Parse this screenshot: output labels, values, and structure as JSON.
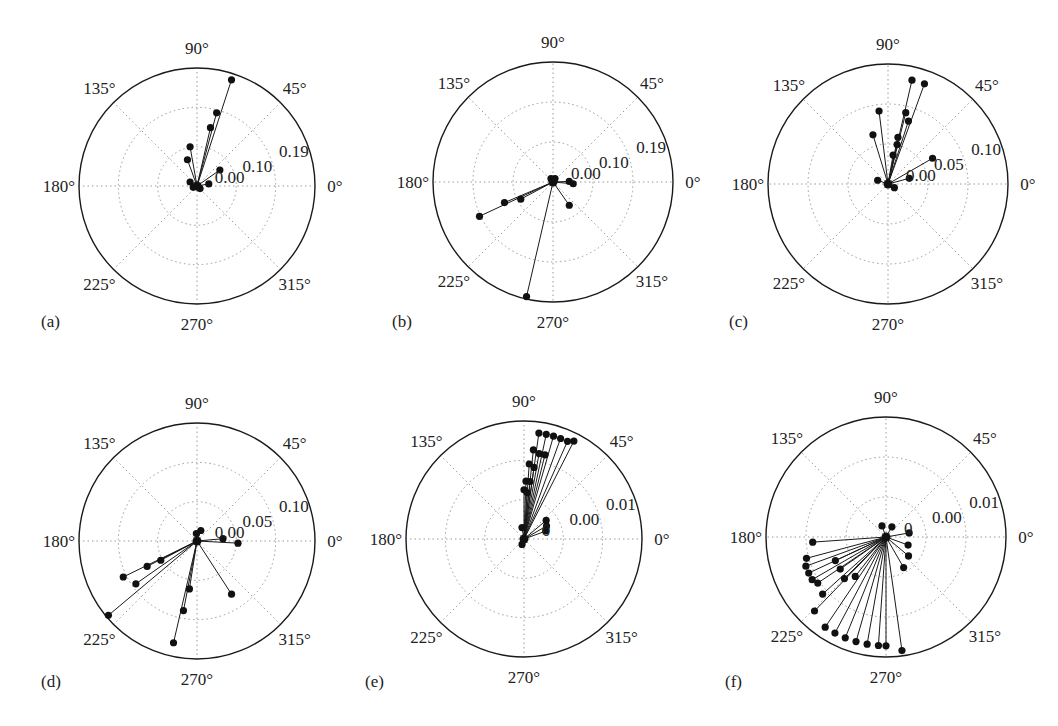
{
  "figure": {
    "angle_tick_labels": [
      "0°",
      "45°",
      "90°",
      "135°",
      "180°",
      "225°",
      "270°",
      "315°"
    ],
    "angle_tick_values": [
      0,
      45,
      90,
      135,
      180,
      225,
      270,
      315
    ]
  },
  "chart_data": [
    {
      "type": "scatter",
      "subtype": "polar-stem",
      "panel": "(a)",
      "title": "",
      "angle_ticks": [
        "0°",
        "45°",
        "90°",
        "135°",
        "180°",
        "225°",
        "270°",
        "315°"
      ],
      "radial_ticks": [
        "0.00",
        "0.10",
        "0.19"
      ],
      "rmax": 0.29,
      "grid": true,
      "points": [
        {
          "theta": 72,
          "r": 0.28
        },
        {
          "theta": 75,
          "r": 0.19
        },
        {
          "theta": 77,
          "r": 0.15
        },
        {
          "theta": 100,
          "r": 0.1
        },
        {
          "theta": 110,
          "r": 0.07
        },
        {
          "theta": 35,
          "r": 0.07
        },
        {
          "theta": 10,
          "r": 0.03
        },
        {
          "theta": 150,
          "r": 0.02
        },
        {
          "theta": 200,
          "r": 0.01
        },
        {
          "theta": 320,
          "r": 0.01
        }
      ]
    },
    {
      "type": "scatter",
      "subtype": "polar-stem",
      "panel": "(b)",
      "title": "",
      "angle_ticks": [
        "0°",
        "45°",
        "90°",
        "135°",
        "180°",
        "225°",
        "270°",
        "315°"
      ],
      "radial_ticks": [
        "0.00",
        "0.10",
        "0.19"
      ],
      "rmax": 0.29,
      "grid": true,
      "points": [
        {
          "theta": 257,
          "r": 0.29
        },
        {
          "theta": 205,
          "r": 0.2
        },
        {
          "theta": 203,
          "r": 0.13
        },
        {
          "theta": 208,
          "r": 0.09
        },
        {
          "theta": 305,
          "r": 0.07
        },
        {
          "theta": 355,
          "r": 0.05
        },
        {
          "theta": 2,
          "r": 0.04
        },
        {
          "theta": 60,
          "r": 0.01
        },
        {
          "theta": 120,
          "r": 0.01
        }
      ]
    },
    {
      "type": "scatter",
      "subtype": "polar-stem",
      "panel": "(c)",
      "title": "",
      "angle_ticks": [
        "0°",
        "45°",
        "90°",
        "135°",
        "180°",
        "225°",
        "270°",
        "315°"
      ],
      "radial_ticks": [
        "0.00",
        "0.05",
        "0.10"
      ],
      "rmax": 0.16,
      "grid": true,
      "points": [
        {
          "theta": 77,
          "r": 0.145
        },
        {
          "theta": 70,
          "r": 0.145
        },
        {
          "theta": 97,
          "r": 0.1
        },
        {
          "theta": 76,
          "r": 0.1
        },
        {
          "theta": 72,
          "r": 0.09
        },
        {
          "theta": 107,
          "r": 0.07
        },
        {
          "theta": 78,
          "r": 0.065
        },
        {
          "theta": 77,
          "r": 0.055
        },
        {
          "theta": 80,
          "r": 0.04
        },
        {
          "theta": 30,
          "r": 0.07
        },
        {
          "theta": 15,
          "r": 0.03
        },
        {
          "theta": 160,
          "r": 0.015
        },
        {
          "theta": 330,
          "r": 0.01
        }
      ]
    },
    {
      "type": "scatter",
      "subtype": "polar-stem",
      "panel": "(d)",
      "title": "",
      "angle_ticks": [
        "0°",
        "45°",
        "90°",
        "135°",
        "180°",
        "225°",
        "270°",
        "315°"
      ],
      "radial_ticks": [
        "0.00",
        "0.05",
        "0.10"
      ],
      "rmax": 0.155,
      "grid": true,
      "points": [
        {
          "theta": 220,
          "r": 0.155
        },
        {
          "theta": 206,
          "r": 0.11
        },
        {
          "theta": 215,
          "r": 0.1
        },
        {
          "theta": 207,
          "r": 0.075
        },
        {
          "theta": 208,
          "r": 0.055
        },
        {
          "theta": 257,
          "r": 0.14
        },
        {
          "theta": 259,
          "r": 0.095
        },
        {
          "theta": 261,
          "r": 0.065
        },
        {
          "theta": 303,
          "r": 0.085
        },
        {
          "theta": 357,
          "r": 0.055
        },
        {
          "theta": 5,
          "r": 0.035
        },
        {
          "theta": 70,
          "r": 0.015
        },
        {
          "theta": 95,
          "r": 0.01
        }
      ]
    },
    {
      "type": "scatter",
      "subtype": "polar-stem",
      "panel": "(e)",
      "title": "",
      "angle_ticks": [
        "0°",
        "45°",
        "90°",
        "135°",
        "180°",
        "225°",
        "270°",
        "315°"
      ],
      "radial_ticks": [
        "0",
        "0.00",
        "0.01"
      ],
      "rmax": 0.02,
      "grid": true,
      "note": "dense fan of stems between ~62° and ~88°",
      "points": [
        {
          "theta": 63,
          "r": 0.019
        },
        {
          "theta": 66,
          "r": 0.0185
        },
        {
          "theta": 70,
          "r": 0.0185
        },
        {
          "theta": 74,
          "r": 0.0185
        },
        {
          "theta": 78,
          "r": 0.0185
        },
        {
          "theta": 82,
          "r": 0.0185
        },
        {
          "theta": 84,
          "r": 0.0155
        },
        {
          "theta": 80,
          "r": 0.015
        },
        {
          "theta": 76,
          "r": 0.015
        },
        {
          "theta": 86,
          "r": 0.013
        },
        {
          "theta": 82,
          "r": 0.0125
        },
        {
          "theta": 88,
          "r": 0.01
        },
        {
          "theta": 84,
          "r": 0.01
        },
        {
          "theta": 90,
          "r": 0.0085
        },
        {
          "theta": 86,
          "r": 0.008
        },
        {
          "theta": 40,
          "r": 0.005
        },
        {
          "theta": 30,
          "r": 0.0045
        },
        {
          "theta": 20,
          "r": 0.004
        },
        {
          "theta": 100,
          "r": 0.002
        },
        {
          "theta": 250,
          "r": 0.001
        }
      ]
    },
    {
      "type": "scatter",
      "subtype": "polar-stem",
      "panel": "(f)",
      "title": "",
      "angle_ticks": [
        "0°",
        "45°",
        "90°",
        "135°",
        "180°",
        "225°",
        "270°",
        "315°"
      ],
      "radial_ticks": [
        "0",
        "0.00",
        "0.01"
      ],
      "rmax": 0.02,
      "grid": true,
      "note": "dense fan of stems between ~185° and ~285°",
      "points": [
        {
          "theta": 184,
          "r": 0.0125
        },
        {
          "theta": 195,
          "r": 0.014
        },
        {
          "theta": 200,
          "r": 0.0145
        },
        {
          "theta": 205,
          "r": 0.0145
        },
        {
          "theta": 210,
          "r": 0.0145
        },
        {
          "theta": 214,
          "r": 0.014
        },
        {
          "theta": 222,
          "r": 0.0145
        },
        {
          "theta": 226,
          "r": 0.0175
        },
        {
          "theta": 236,
          "r": 0.0185
        },
        {
          "theta": 242,
          "r": 0.0185
        },
        {
          "theta": 248,
          "r": 0.0185
        },
        {
          "theta": 254,
          "r": 0.0185
        },
        {
          "theta": 260,
          "r": 0.0185
        },
        {
          "theta": 266,
          "r": 0.0185
        },
        {
          "theta": 270,
          "r": 0.0185
        },
        {
          "theta": 278,
          "r": 0.0195
        },
        {
          "theta": 205,
          "r": 0.0095
        },
        {
          "theta": 215,
          "r": 0.0095
        },
        {
          "theta": 225,
          "r": 0.01
        },
        {
          "theta": 232,
          "r": 0.0085
        },
        {
          "theta": 300,
          "r": 0.006
        },
        {
          "theta": 320,
          "r": 0.005
        },
        {
          "theta": 340,
          "r": 0.004
        },
        {
          "theta": 10,
          "r": 0.004
        },
        {
          "theta": 60,
          "r": 0.002
        },
        {
          "theta": 110,
          "r": 0.002
        }
      ]
    }
  ],
  "panels": [
    {
      "label": "(a)",
      "cx": 197,
      "cy": 186,
      "R": 118,
      "label_x": 41,
      "label_y": 312
    },
    {
      "label": "(b)",
      "cx": 553,
      "cy": 182,
      "R": 120,
      "label_x": 392,
      "label_y": 312
    },
    {
      "label": "(c)",
      "cx": 888,
      "cy": 184,
      "R": 120,
      "label_x": 729,
      "label_y": 312
    },
    {
      "label": "(d)",
      "cx": 197,
      "cy": 541,
      "R": 118,
      "label_x": 41,
      "label_y": 672
    },
    {
      "label": "(e)",
      "cx": 524,
      "cy": 539,
      "R": 118,
      "label_x": 365,
      "label_y": 672
    },
    {
      "label": "(f)",
      "cx": 886,
      "cy": 537,
      "R": 120,
      "label_x": 725,
      "label_y": 672
    }
  ],
  "colors": {
    "stroke": "#1a1a1a",
    "grid": "#9a9a9a",
    "marker": "#111111",
    "text": "#222222"
  }
}
